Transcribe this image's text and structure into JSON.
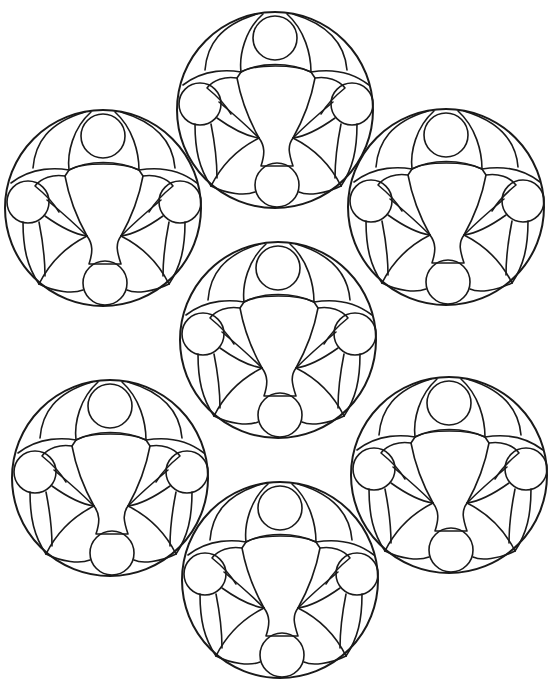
{
  "page": {
    "type": "coloring-page",
    "line_color": "#1a1a1a",
    "background": "#ffffff"
  },
  "medallions": [
    {
      "id": "top",
      "cx": 275,
      "cy": 110,
      "r": 98
    },
    {
      "id": "upper-left",
      "cx": 103,
      "cy": 208,
      "r": 98
    },
    {
      "id": "upper-right",
      "cx": 446,
      "cy": 207,
      "r": 98
    },
    {
      "id": "center",
      "cx": 278,
      "cy": 340,
      "r": 98
    },
    {
      "id": "lower-left",
      "cx": 110,
      "cy": 478,
      "r": 98
    },
    {
      "id": "lower-right",
      "cx": 449,
      "cy": 475,
      "r": 98
    },
    {
      "id": "bottom",
      "cx": 280,
      "cy": 580,
      "r": 98
    }
  ],
  "caption": {
    "text": ""
  }
}
